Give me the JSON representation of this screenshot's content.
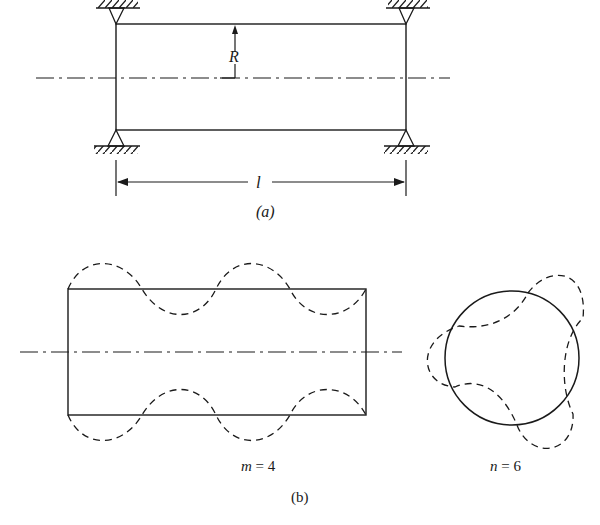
{
  "figure": {
    "part_a": {
      "caption": "(a)",
      "radius_label": "R",
      "length_label": "l",
      "supports": [
        "top-left",
        "top-right",
        "bottom-left",
        "bottom-right"
      ],
      "description": "Simply supported cylindrical shell of radius R and length l"
    },
    "part_b": {
      "caption": "(b)",
      "axial_mode_label": "m = 4",
      "circumferential_mode_label": "n = 6",
      "description": "Axial (m) and circumferential (n) vibration mode shapes"
    },
    "colors": {
      "line": "#1a1a1a",
      "background": "#ffffff"
    }
  }
}
